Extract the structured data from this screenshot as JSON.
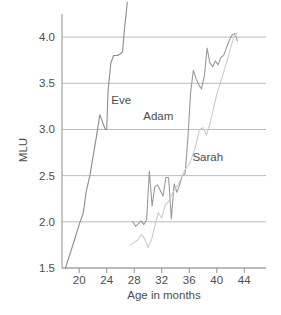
{
  "chart_data": {
    "type": "line",
    "title": "",
    "xlabel": "Age in months",
    "ylabel": "MLU",
    "xlim": [
      17.5,
      46
    ],
    "ylim": [
      1.5,
      4.25
    ],
    "grid": true,
    "grid_axis": "y",
    "legend": "inline-labels",
    "xticks": [
      20,
      24,
      28,
      32,
      36,
      40,
      44
    ],
    "xtick_labels": [
      "20",
      "24",
      "28",
      "32",
      "36",
      "40",
      "44"
    ],
    "yticks": [
      1.5,
      2.0,
      2.5,
      3.0,
      3.5,
      4.0
    ],
    "ytick_labels": [
      "1.5",
      "2.0",
      "2.5",
      "3.0",
      "3.5",
      "4.0"
    ],
    "series": [
      {
        "name": "Eve",
        "color": "#8c8c8c",
        "label_x": 26.1,
        "label_y": 3.28,
        "x": [
          18.0,
          19.0,
          20.0,
          20.6,
          21.0,
          21.6,
          22.0,
          22.5,
          23.0,
          23.4,
          23.8,
          24.0,
          24.2,
          24.6,
          25.0,
          25.6,
          26.0,
          26.3,
          26.6,
          27.0
        ],
        "y": [
          1.5,
          1.73,
          1.97,
          2.1,
          2.32,
          2.52,
          2.7,
          2.92,
          3.16,
          3.08,
          3.0,
          3.0,
          3.42,
          3.72,
          3.8,
          3.8,
          3.82,
          3.84,
          4.1,
          4.38
        ]
      },
      {
        "name": "Adam",
        "color": "#9a9a9a",
        "label_x": 31.5,
        "label_y": 3.1,
        "x": [
          27.8,
          28.2,
          28.6,
          29.0,
          29.4,
          29.8,
          30.2,
          30.6,
          31.0,
          31.4,
          31.8,
          32.2,
          32.6,
          33.0,
          33.4,
          33.8,
          34.2,
          34.6,
          35.0,
          35.4,
          35.8,
          36.2,
          36.6,
          37.0,
          37.4,
          37.8,
          38.2,
          38.6,
          39.0,
          39.4,
          39.8,
          40.2,
          40.6,
          41.0,
          41.4,
          41.8,
          42.2,
          42.6,
          43.0
        ],
        "y": [
          2.0,
          1.95,
          1.98,
          2.01,
          1.97,
          2.02,
          2.55,
          2.17,
          2.38,
          2.4,
          2.34,
          2.28,
          2.48,
          2.48,
          2.03,
          2.41,
          2.32,
          2.4,
          2.5,
          2.52,
          2.9,
          3.4,
          3.64,
          3.55,
          3.48,
          3.44,
          3.58,
          3.88,
          3.72,
          3.68,
          3.74,
          3.7,
          3.78,
          3.8,
          3.88,
          3.96,
          4.02,
          4.04,
          3.96
        ]
      },
      {
        "name": "Sarah",
        "color": "#cccccc",
        "label_x": 38.7,
        "label_y": 2.66,
        "x": [
          27.5,
          28.0,
          28.5,
          29.0,
          29.5,
          30.0,
          30.5,
          31.0,
          31.5,
          32.0,
          32.5,
          33.0,
          33.5,
          34.0,
          34.5,
          35.0,
          35.5,
          36.0,
          36.5,
          37.0,
          37.5,
          38.0,
          38.5,
          39.0,
          39.5,
          40.0,
          40.5,
          41.0,
          41.5,
          42.0,
          42.5,
          43.0
        ],
        "y": [
          1.75,
          1.78,
          1.8,
          1.86,
          1.82,
          1.72,
          1.8,
          1.96,
          2.1,
          2.04,
          2.18,
          2.22,
          2.3,
          2.36,
          2.42,
          2.5,
          2.58,
          2.62,
          2.72,
          2.84,
          3.0,
          3.02,
          2.94,
          3.06,
          3.22,
          3.38,
          3.5,
          3.62,
          3.74,
          3.88,
          4.0,
          4.05
        ]
      }
    ]
  },
  "axis": {
    "line_color": "#999999",
    "grid_color": "#b3b3b3",
    "text_color": "#4d4d4d"
  }
}
